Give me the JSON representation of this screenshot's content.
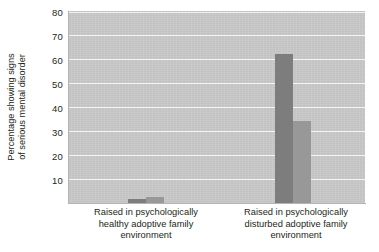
{
  "chart_data": {
    "type": "bar",
    "title": "",
    "subtitle": "",
    "xlabel": "",
    "ylabel": "Percentage showing signs of serious mental disorder",
    "ylabel_lines": [
      "Percentage showing signs",
      "of serious mental disorder"
    ],
    "ylim": [
      0,
      80
    ],
    "yticks": [
      10,
      20,
      30,
      40,
      50,
      60,
      70,
      80
    ],
    "ytick_labels": [
      "10",
      "20",
      "30",
      "40",
      "50",
      "60",
      "70",
      "80"
    ],
    "grid": true,
    "grid_axis": "y",
    "legend": false,
    "legend_position": "none",
    "categories": [
      "Raised in psychologically healthy adoptive family environment",
      "Raised in psychologically disturbed adoptive family environment"
    ],
    "category_label_lines": [
      [
        "Raised in psychologically",
        "healthy adoptive family",
        "environment"
      ],
      [
        "Raised in psychologically",
        "disturbed adoptive family",
        "environment"
      ]
    ],
    "series": [
      {
        "name": "Series 1",
        "values": [
          1.5,
          62
        ]
      },
      {
        "name": "Series 2",
        "values": [
          2.5,
          34
        ]
      }
    ],
    "bars": [
      {
        "category_index": 0,
        "series_index": 0,
        "value": 1.5,
        "color": "#7d7d7d"
      },
      {
        "category_index": 0,
        "series_index": 1,
        "value": 2.5,
        "color": "#989898"
      },
      {
        "category_index": 1,
        "series_index": 0,
        "value": 62,
        "color": "#7d7d7d"
      },
      {
        "category_index": 1,
        "series_index": 1,
        "value": 34,
        "color": "#989898"
      }
    ],
    "colors": {
      "plot_background": "#c9c9c9",
      "gridline": "#f2f2f2",
      "bar_dark": "#7d7d7d",
      "bar_mid": "#989898",
      "text": "#231f20",
      "page_background": "#ffffff"
    }
  }
}
